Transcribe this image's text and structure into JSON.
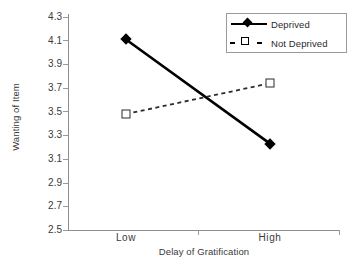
{
  "chart_data": {
    "type": "line",
    "title": "",
    "xlabel": "Delay of Gratification",
    "ylabel": "Wanting of Item",
    "categories": [
      "Low",
      "High"
    ],
    "series": [
      {
        "name": "Deprived",
        "values": [
          4.11,
          3.23
        ],
        "style": "solid",
        "marker": "filled-diamond"
      },
      {
        "name": "Not Deprived",
        "values": [
          3.48,
          3.74
        ],
        "style": "dashed",
        "marker": "open-square"
      }
    ],
    "ylim": [
      2.5,
      4.3
    ],
    "ytick_step": 0.2,
    "yticks": [
      "4.3",
      "4.1",
      "3.9",
      "3.7",
      "3.5",
      "3.3",
      "3.1",
      "2.9",
      "2.7",
      "2.5"
    ],
    "xticks": [
      "Low",
      "High"
    ],
    "grid": false,
    "legend_position": "top-right",
    "colors": {
      "line": "#000000",
      "axis": "#8d8d8d",
      "text": "#3a3a3a"
    }
  },
  "legend": {
    "items": [
      {
        "label": "Deprived"
      },
      {
        "label": "Not Deprived"
      }
    ]
  }
}
